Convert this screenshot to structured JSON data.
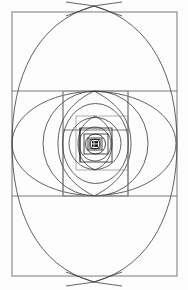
{
  "figure": {
    "kind": "geometric-diagram",
    "background_color": "#fdfdfd",
    "line_color": "#6b6b6b",
    "arc_color": "#3a3a3a",
    "core_color": "#1f1f1f",
    "canvas": {
      "width": 188,
      "height": 290
    }
  },
  "geometry": {
    "outer_rectangle": {
      "x": 12,
      "y": 12,
      "width": 165,
      "height": 264
    },
    "golden_ratio": 1.618,
    "center": {
      "x": 94,
      "y": 144
    },
    "vesica_extremes": {
      "top": {
        "x": 94,
        "y": 6
      },
      "bottom": {
        "x": 94,
        "y": 282
      },
      "left": {
        "x": 12,
        "y": 143
      },
      "right": {
        "x": 177,
        "y": 143
      }
    },
    "horizontal_divisions": [
      91,
      196
    ],
    "vertical_divisions": [
      63,
      128
    ],
    "nesting_levels": 7,
    "contraction_factor": 0.618
  },
  "labels": {
    "none_visible": ""
  }
}
